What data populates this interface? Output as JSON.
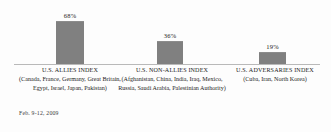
{
  "chart_data": {
    "type": "bar",
    "title": "",
    "subtitle": "",
    "xlabel": "",
    "ylabel": "",
    "ylim": [
      0,
      100
    ],
    "grid": false,
    "legend": "none",
    "categories": [
      "U.S. ALLIES INDEX",
      "U.S. NON-ALLIES INDEX",
      "U.S. ADVERSARIES INDEX"
    ],
    "category_members": [
      "(Canada, France, Germany, Great Britain, Egypt, Israel, Japan, Pakistan)",
      "(Afghanistan, China, India, Iraq, Mexico, Russia, Saudi Arabia, Palestinian Authority)",
      "(Cuba, Iran, North Korea)"
    ],
    "values": [
      68,
      36,
      19
    ],
    "value_labels": [
      "68%",
      "36%",
      "19%"
    ],
    "bar_color": "#808080",
    "axis_color": "#b9b9b9",
    "background_color": "#fdfdfd",
    "annotations": [
      "Feb. 9-12, 2009"
    ]
  },
  "footnote": {
    "date_range": "Feb. 9-12, 2009"
  }
}
